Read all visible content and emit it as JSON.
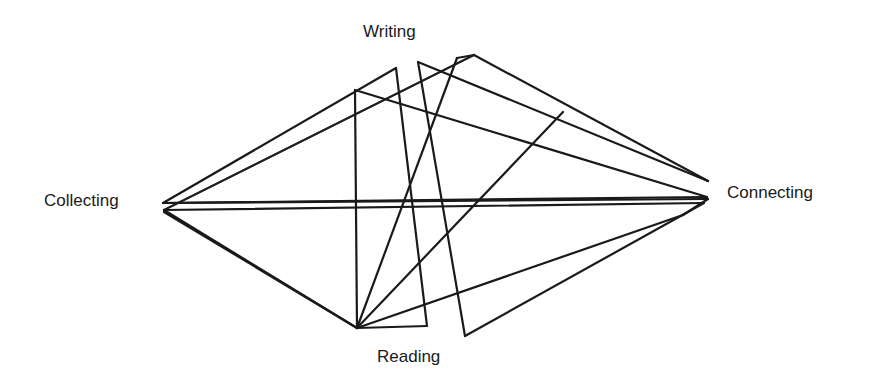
{
  "diagram": {
    "title": "",
    "nodes": {
      "writing": "Writing",
      "collecting": "Collecting",
      "connecting": "Connecting",
      "reading": "Reading"
    },
    "stroke_color": "#1a1a1a",
    "path_sequence": [
      "collecting",
      "writing",
      "reading",
      "writing",
      "connecting",
      "collecting",
      "writing",
      "reading",
      "connecting",
      "reading",
      "writing",
      "connecting",
      "reading",
      "writing",
      "reading",
      "connecting",
      "collecting",
      "reading",
      "collecting"
    ]
  }
}
